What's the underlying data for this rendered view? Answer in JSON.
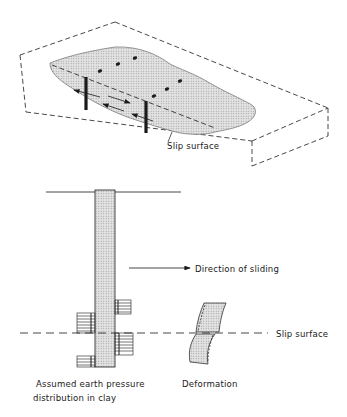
{
  "figure": {
    "top_view": {
      "title": "Isometric view of slope with piles",
      "labels": {
        "slip_surface": "Slip surface"
      }
    },
    "section_view": {
      "labels": {
        "direction": "Direction of sliding",
        "slip_surface": "Slip surface",
        "pressure_line1": "Assumed earth pressure",
        "pressure_line2": "distribution in clay",
        "deformation": "Deformation"
      }
    },
    "colors": {
      "ink": "#1a1a1a",
      "fill": "#d9d9d9",
      "background": "#ffffff"
    }
  }
}
